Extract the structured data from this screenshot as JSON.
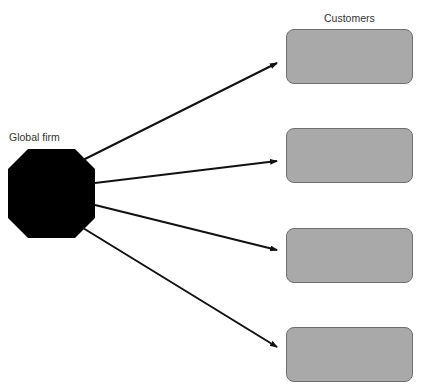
{
  "diagram": {
    "firm": {
      "label": "Global firm",
      "shape": "octagon",
      "color": "#000000"
    },
    "customers": {
      "heading": "Customers",
      "boxes": [
        {
          "id": 1,
          "color": "#a9a9a9"
        },
        {
          "id": 2,
          "color": "#a9a9a9"
        },
        {
          "id": 3,
          "color": "#a9a9a9"
        },
        {
          "id": 4,
          "color": "#a9a9a9"
        }
      ]
    },
    "arrows": [
      {
        "from": "Global firm",
        "to": "Customer 1"
      },
      {
        "from": "Global firm",
        "to": "Customer 2"
      },
      {
        "from": "Global firm",
        "to": "Customer 3"
      },
      {
        "from": "Global firm",
        "to": "Customer 4"
      }
    ]
  }
}
